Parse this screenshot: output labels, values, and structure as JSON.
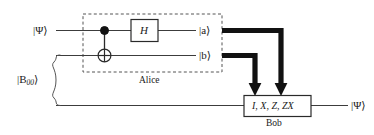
{
  "diagram": {
    "colors": {
      "wire": "#3c3c3c",
      "classical_wire": "#111111",
      "box_stroke": "#2a2a2a",
      "dashed_stroke": "#555555",
      "text": "#1a1a1a",
      "background": "#ffffff"
    },
    "inputs": [
      {
        "id": "psi-in",
        "label": "|Ψ⟩",
        "wire": "top"
      },
      {
        "id": "bell-pair",
        "label": "|B",
        "sub": "00",
        "label_close": "⟩",
        "wire": "bottom-pair"
      }
    ],
    "gates": [
      {
        "id": "hadamard",
        "label": "H",
        "type": "single-qubit"
      },
      {
        "id": "cnot",
        "label": "",
        "type": "controlled-not"
      }
    ],
    "measurements": [
      {
        "id": "a-out",
        "label": "|a⟩"
      },
      {
        "id": "b-out",
        "label": "|b⟩"
      }
    ],
    "regions": [
      {
        "id": "alice",
        "label": "Alice",
        "style": "dashed"
      },
      {
        "id": "bob",
        "label": "Bob",
        "style": "solid"
      }
    ],
    "bob_box": {
      "operations": "I, X, Z, ZX"
    },
    "outputs": [
      {
        "id": "psi-out",
        "label": "|Ψ⟩"
      }
    ]
  }
}
